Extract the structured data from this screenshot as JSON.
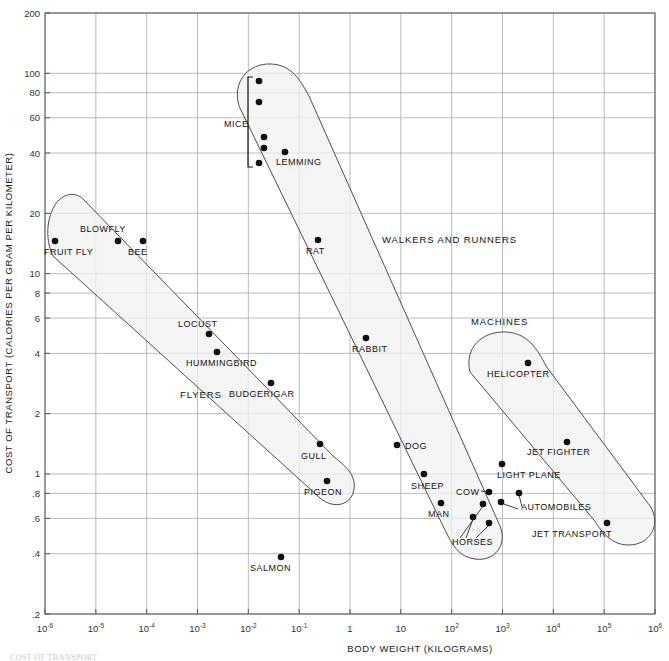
{
  "chart_data": {
    "type": "scatter",
    "title": "",
    "xlabel": "BODY WEIGHT (KILOGRAMS)",
    "ylabel": "COST OF TRANSPORT (CALORIES PER GRAM PER KILOMETER)",
    "xscale": "log",
    "yscale": "log",
    "xlim": [
      1e-06,
      1000000.0
    ],
    "ylim": [
      0.2,
      200
    ],
    "grid": true,
    "legend": "none",
    "xticks": [
      {
        "value": 1e-06,
        "label": "10",
        "sup": "-6"
      },
      {
        "value": 1e-05,
        "label": "10",
        "sup": "-5"
      },
      {
        "value": 0.0001,
        "label": "10",
        "sup": "-4"
      },
      {
        "value": 0.001,
        "label": "10",
        "sup": "-3"
      },
      {
        "value": 0.01,
        "label": "10",
        "sup": "-2"
      },
      {
        "value": 0.1,
        "label": "10",
        "sup": "-1"
      },
      {
        "value": 1,
        "label": "1",
        "sup": ""
      },
      {
        "value": 10,
        "label": "10",
        "sup": ""
      },
      {
        "value": 100,
        "label": "10",
        "sup": "2"
      },
      {
        "value": 1000,
        "label": "10",
        "sup": "3"
      },
      {
        "value": 10000,
        "label": "10",
        "sup": "4"
      },
      {
        "value": 100000,
        "label": "10",
        "sup": "5"
      },
      {
        "value": 1000000,
        "label": "10",
        "sup": "6"
      }
    ],
    "yticks": [
      {
        "value": 200,
        "label": "200"
      },
      {
        "value": 100,
        "label": "100"
      },
      {
        "value": 80,
        "label": "80"
      },
      {
        "value": 60,
        "label": "60"
      },
      {
        "value": 40,
        "label": "40"
      },
      {
        "value": 20,
        "label": "20"
      },
      {
        "value": 10,
        "label": "10"
      },
      {
        "value": 8,
        "label": "8"
      },
      {
        "value": 6,
        "label": "6"
      },
      {
        "value": 4,
        "label": "4"
      },
      {
        "value": 2,
        "label": "2"
      },
      {
        "value": 1,
        "label": "1"
      },
      {
        "value": 0.8,
        "label": ".8"
      },
      {
        "value": 0.6,
        "label": ".6"
      },
      {
        "value": 0.4,
        "label": ".4"
      },
      {
        "value": 0.2,
        "label": ".2"
      }
    ],
    "groups": [
      {
        "name": "FLYERS",
        "label_px": [
          180,
          398
        ]
      },
      {
        "name": "WALKERS AND RUNNERS",
        "label_px": [
          382,
          243
        ]
      },
      {
        "name": "MACHINES",
        "label_px": [
          471,
          325
        ]
      }
    ],
    "points": [
      {
        "name": "FRUIT FLY",
        "x": 1.2e-06,
        "y": 13,
        "px": [
          55,
          241
        ],
        "label_px": [
          44,
          255
        ],
        "anchor": "start"
      },
      {
        "name": "BLOWFLY",
        "x": 3e-05,
        "y": 13,
        "px": [
          118,
          241
        ],
        "label_px": [
          80,
          232
        ],
        "anchor": "start"
      },
      {
        "name": "BEE",
        "x": 0.00011,
        "y": 13,
        "px": [
          143,
          241
        ],
        "label_px": [
          128,
          255
        ],
        "anchor": "start"
      },
      {
        "name": "LOCUST",
        "x": 0.0015,
        "y": 5.0,
        "px": [
          209,
          334
        ],
        "label_px": [
          178,
          327
        ],
        "anchor": "start"
      },
      {
        "name": "HUMMINGBIRD",
        "x": 0.0025,
        "y": 4.1,
        "px": [
          217,
          352
        ],
        "label_px": [
          186,
          366
        ],
        "anchor": "start"
      },
      {
        "name": "BUDGERIGAR",
        "x": 0.035,
        "y": 3.0,
        "px": [
          271,
          383
        ],
        "label_px": [
          229,
          397
        ],
        "anchor": "start"
      },
      {
        "name": "GULL",
        "x": 0.9,
        "y": 1.5,
        "px": [
          320,
          444
        ],
        "label_px": [
          301,
          459
        ],
        "anchor": "start"
      },
      {
        "name": "PIGEON",
        "x": 0.35,
        "y": 0.95,
        "px": [
          327,
          481
        ],
        "label_px": [
          304,
          495
        ],
        "anchor": "start"
      },
      {
        "name": "SALMON",
        "x": 0.045,
        "y": 0.4,
        "px": [
          281,
          557
        ],
        "label_px": [
          250,
          571
        ],
        "anchor": "start"
      },
      {
        "name": "MICE-1",
        "x": 0.013,
        "y": 92,
        "px": [
          259,
          81
        ],
        "label_px": null,
        "anchor": "start"
      },
      {
        "name": "MICE-2",
        "x": 0.013,
        "y": 72,
        "px": [
          259,
          102
        ],
        "label_px": null,
        "anchor": "start"
      },
      {
        "name": "MICE-3",
        "x": 0.014,
        "y": 49,
        "px": [
          264,
          137
        ],
        "label_px": null,
        "anchor": "start"
      },
      {
        "name": "MICE-4",
        "x": 0.014,
        "y": 43,
        "px": [
          264,
          148
        ],
        "label_px": null,
        "anchor": "start"
      },
      {
        "name": "MICE-5",
        "x": 0.013,
        "y": 36,
        "px": [
          259,
          163
        ],
        "label_px": null,
        "anchor": "start"
      },
      {
        "name": "MICE",
        "x": null,
        "y": null,
        "px": null,
        "label_px": [
          224,
          127
        ],
        "anchor": "start"
      },
      {
        "name": "LEMMING",
        "x": 0.035,
        "y": 41,
        "px": [
          285,
          152
        ],
        "label_px": [
          276,
          165
        ],
        "anchor": "start"
      },
      {
        "name": "RAT",
        "x": 2.3,
        "y": 13,
        "px": [
          318,
          240
        ],
        "label_px": [
          306,
          254
        ],
        "anchor": "start"
      },
      {
        "name": "RABBIT",
        "x": 2.4,
        "y": 4.6,
        "px": [
          366,
          338
        ],
        "label_px": [
          352,
          352
        ],
        "anchor": "start"
      },
      {
        "name": "DOG",
        "x": 11,
        "y": 1.5,
        "px": [
          397,
          445
        ],
        "label_px": [
          405,
          449
        ],
        "anchor": "start"
      },
      {
        "name": "SHEEP",
        "x": 32,
        "y": 1.1,
        "px": [
          424,
          474
        ],
        "label_px": [
          411,
          489
        ],
        "anchor": "start"
      },
      {
        "name": "MAN",
        "x": 70,
        "y": 0.75,
        "px": [
          441,
          503
        ],
        "label_px": [
          428,
          517
        ],
        "anchor": "start"
      },
      {
        "name": "COW",
        "x": 600,
        "y": 0.85,
        "px": [
          489,
          492
        ],
        "label_px": [
          456,
          495
        ],
        "anchor": "start"
      },
      {
        "name": "HORSE-1",
        "x": 300,
        "y": 0.72,
        "px": [
          483,
          504
        ],
        "label_px": null,
        "anchor": "start"
      },
      {
        "name": "HORSE-2",
        "x": 230,
        "y": 0.62,
        "px": [
          473,
          517
        ],
        "label_px": null,
        "anchor": "start"
      },
      {
        "name": "HORSE-3",
        "x": 450,
        "y": 0.58,
        "px": [
          489,
          523
        ],
        "label_px": null,
        "anchor": "start"
      },
      {
        "name": "HORSES",
        "x": null,
        "y": null,
        "px": null,
        "label_px": [
          452,
          545
        ],
        "anchor": "start"
      },
      {
        "name": "AUTOMOBILE-1",
        "x": 1100,
        "y": 0.72,
        "px": [
          501,
          502
        ],
        "label_px": null,
        "anchor": "start"
      },
      {
        "name": "AUTOMOBILE-2",
        "x": 2100,
        "y": 0.82,
        "px": [
          519,
          493
        ],
        "label_px": null,
        "anchor": "start"
      },
      {
        "name": "AUTOMOBILES",
        "x": null,
        "y": null,
        "px": null,
        "label_px": [
          521,
          510
        ],
        "anchor": "start"
      },
      {
        "name": "HELICOPTER",
        "x": 3000,
        "y": 3.7,
        "px": [
          528,
          363
        ],
        "label_px": [
          487,
          377
        ],
        "anchor": "start"
      },
      {
        "name": "JET FIGHTER",
        "x": 18000,
        "y": 1.5,
        "px": [
          567,
          442
        ],
        "label_px": [
          527,
          455
        ],
        "anchor": "start"
      },
      {
        "name": "LIGHT PLANE",
        "x": 1100,
        "y": 1.05,
        "px": [
          502,
          464
        ],
        "label_px": [
          497,
          478
        ],
        "anchor": "start"
      },
      {
        "name": "JET TRANSPORT",
        "x": 110000.0,
        "y": 0.57,
        "px": [
          607,
          523
        ],
        "label_px": [
          532,
          537
        ],
        "anchor": "start"
      }
    ],
    "hulls": [
      {
        "name": "flyers-hull",
        "path": "M 59 200 C 47 212 44 238 53 256 L 320 498 C 334 510 352 505 354 489 C 356 474 345 466 333 456 L 84 200 C 77 192 66 193 59 200 Z"
      },
      {
        "name": "walkers-hull",
        "path": "M 239 106 C 232 82 248 63 271 64 C 292 65 300 80 309 96 L 500 526 C 508 545 494 562 475 559 C 459 557 452 545 445 530 Z"
      },
      {
        "name": "machines-hull",
        "path": "M 470 372 C 464 348 482 331 506 332 C 527 333 537 348 546 366 L 650 506 C 662 524 650 545 629 545 C 612 545 603 534 594 520 Z"
      }
    ],
    "mice_bracket": {
      "name": "mice-bracket",
      "path": "M 253 77 L 248 77 L 248 167 L 253 167"
    },
    "leaders": [
      {
        "name": "cow-leader",
        "path": "M 481 491 L 489 492"
      },
      {
        "name": "horses-leader-1",
        "path": "M 460 538 L 483 506"
      },
      {
        "name": "horses-leader-2",
        "path": "M 466 538 L 473 519"
      },
      {
        "name": "horses-leader-3",
        "path": "M 476 538 L 489 525"
      },
      {
        "name": "automobiles-leader-1",
        "path": "M 518 509 L 501 503"
      },
      {
        "name": "automobiles-leader-2",
        "path": "M 522 507 L 519 495"
      }
    ]
  },
  "figure": {
    "caption": "COST OF TRANSPORT"
  }
}
